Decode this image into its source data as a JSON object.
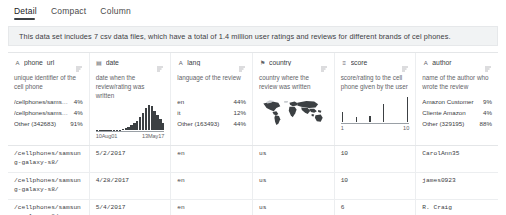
{
  "tabs": [
    {
      "label": "Detail",
      "active": true
    },
    {
      "label": "Compact",
      "active": false
    },
    {
      "label": "Column",
      "active": false
    }
  ],
  "description": "This data set includes 7 csv data files, which have a total of 1.4 million user ratings and reviews for different brands of cel phones.",
  "sort_icon": "sort-icon",
  "columns": [
    {
      "name": "phone_url",
      "type_icon": "text-type-icon",
      "type_glyph": "A",
      "description": "unique identifier of the cell phone",
      "dist_type": "categories",
      "categories": [
        {
          "label": "/cellphones/samsun...",
          "pct": "4%"
        },
        {
          "label": "/cellphones/samsun...",
          "pct": "4%"
        },
        {
          "label": "Other (342683)",
          "pct": "91%"
        }
      ]
    },
    {
      "name": "date",
      "type_icon": "date-type-icon",
      "type_glyph": "▤",
      "description": "date when the review/rating was written",
      "dist_type": "histogram",
      "axis_min": "10Aug01",
      "axis_max": "13May17",
      "bars": [
        1,
        0,
        0,
        1,
        0,
        1,
        1,
        2,
        3,
        5,
        9,
        13,
        20,
        28,
        38,
        52,
        70,
        88,
        100,
        96,
        78,
        62,
        44,
        30
      ]
    },
    {
      "name": "lang",
      "type_icon": "text-type-icon",
      "type_glyph": "A",
      "description": "language of the review",
      "dist_type": "categories",
      "categories": [
        {
          "label": "en",
          "pct": "44%"
        },
        {
          "label": "it",
          "pct": "12%"
        },
        {
          "label": "Other (163493)",
          "pct": "44%"
        }
      ]
    },
    {
      "name": "country",
      "type_icon": "geo-type-icon",
      "type_glyph": "⚑",
      "description": "country where the review was written",
      "dist_type": "map"
    },
    {
      "name": "score",
      "type_icon": "number-type-icon",
      "type_glyph": "≡",
      "description": "score/rating to the cell phone given by the user",
      "dist_type": "spikes",
      "axis_min": "1",
      "axis_max": "10",
      "spikes": [
        {
          "x": 2,
          "h": 10
        },
        {
          "x": 22,
          "h": 5
        },
        {
          "x": 42,
          "h": 6
        },
        {
          "x": 62,
          "h": 18
        },
        {
          "x": 96,
          "h": 25
        }
      ]
    },
    {
      "name": "author",
      "type_icon": "text-type-icon",
      "type_glyph": "A",
      "description": "name of the author who wrote the review",
      "dist_type": "categories",
      "categories": [
        {
          "label": "Amazon Customer",
          "pct": "9%"
        },
        {
          "label": "Cliente Amazon",
          "pct": "4%"
        },
        {
          "label": "Other (329195)",
          "pct": "88%"
        }
      ]
    }
  ],
  "rows": [
    {
      "phone_url": "/cellphones/samsung-galaxy-s8/",
      "date": "5/2/2017",
      "lang": "en",
      "country": "us",
      "score": "10",
      "author": "CarolAnn35"
    },
    {
      "phone_url": "/cellphones/samsung-galaxy-s8/",
      "date": "4/28/2017",
      "lang": "en",
      "country": "us",
      "score": "10",
      "author": "james0923"
    },
    {
      "phone_url": "/cellphones/samsung-galaxy-s8/",
      "date": "5/4/2017",
      "lang": "en",
      "country": "us",
      "score": "6",
      "author": "R. Craig"
    }
  ],
  "colors": {
    "text_primary": "#3c4043",
    "text_secondary": "#5f6368",
    "banner_bg": "#f1f3f4",
    "chart_fill": "#3c4043",
    "border": "#eceef0"
  }
}
